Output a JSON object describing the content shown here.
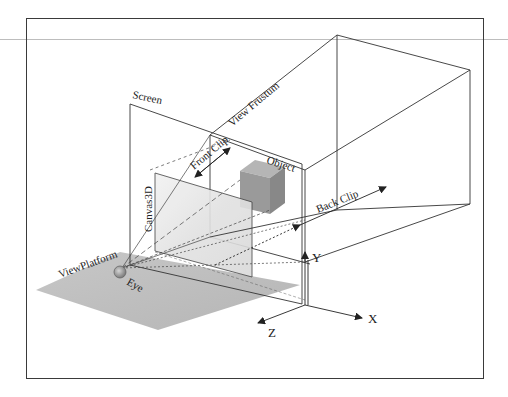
{
  "diagram": {
    "labels": {
      "screen": "Screen",
      "view_frustum": "View Frustum",
      "front_clip": "Front Clip",
      "object": "Object",
      "canvas3d": "Canvas3D",
      "back_clip": "Back Clip",
      "view_platform": "ViewPlatform",
      "eye": "Eye",
      "axis_x": "X",
      "axis_y": "Y",
      "axis_z": "Z"
    },
    "colors": {
      "line": "#333333",
      "frame": "#3a3a3a",
      "platform": "#b0b0b0",
      "object": "#9a9a9a",
      "canvas": "#e6e6e6",
      "eye": "#8c8c8c"
    }
  }
}
